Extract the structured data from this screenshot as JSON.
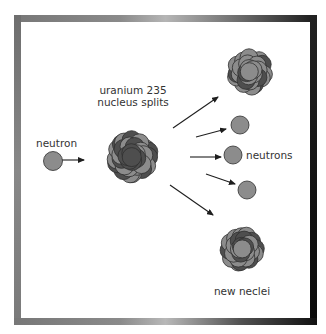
{
  "labels": {
    "neutron": "neutron",
    "uranium_line1": "uranium 235",
    "uranium_line2": "nucleus splits",
    "neutrons": "neutrons",
    "new_nuclei": "new neclei"
  },
  "colors": {
    "light_particle": "#8c8c8c",
    "dark_particle": "#4e4e4e",
    "outline": "#2e2e2e",
    "arrow": "#1e1e1e",
    "text": "#333333"
  },
  "incoming_neutron": {
    "cx": 53,
    "cy": 161,
    "r": 9.5
  },
  "emitted_neutrons": [
    {
      "cx": 240,
      "cy": 125,
      "r": 9
    },
    {
      "cx": 233,
      "cy": 155,
      "r": 9
    },
    {
      "cx": 247,
      "cy": 190,
      "r": 9
    }
  ],
  "arrows": [
    {
      "x1": 62,
      "y1": 160,
      "x2": 84,
      "y2": 160
    },
    {
      "x1": 173,
      "y1": 128,
      "x2": 218,
      "y2": 97
    },
    {
      "x1": 196,
      "y1": 137,
      "x2": 226,
      "y2": 129
    },
    {
      "x1": 190,
      "y1": 157,
      "x2": 221,
      "y2": 157
    },
    {
      "x1": 206,
      "y1": 174,
      "x2": 235,
      "y2": 184
    },
    {
      "x1": 170,
      "y1": 185,
      "x2": 213,
      "y2": 215
    }
  ],
  "nuclei": {
    "uranium": {
      "cx": 132,
      "cy": 157,
      "spread": 40,
      "ball_r": 9.5
    },
    "daughter_top": {
      "cx": 250,
      "cy": 72,
      "spread": 33,
      "ball_r": 9
    },
    "daughter_bottom": {
      "cx": 242,
      "cy": 249,
      "spread": 32,
      "ball_r": 9
    }
  }
}
